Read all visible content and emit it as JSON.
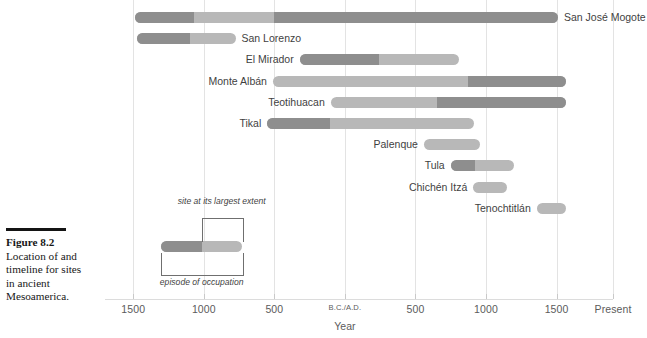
{
  "caption": {
    "rule": "horizontal-rule",
    "title": "Figure 8.2",
    "body": "Location of and timeline for sites in ancient Mesoamerica."
  },
  "legend": {
    "upper_label": "site at its largest extent",
    "lower_label": "episode of occupation"
  },
  "chart_data": {
    "type": "bar",
    "title": "Figure 8.2 Location of and timeline for sites in ancient Mesoamerica.",
    "xlabel": "Year",
    "ylabel": "",
    "grid": true,
    "legend_position": "inset-lower-left",
    "orientation": "horizontal",
    "note": "Horizontal timeline (Gantt style). Negative years = B.C., positive = A.D. Each site has a full occupation span (light gray) and a sub-span at its largest extent (dark gray).",
    "xlim": [
      -1700,
      1900
    ],
    "xticks": [
      -1500,
      -1000,
      -500,
      0,
      500,
      1000,
      1500,
      1900
    ],
    "xticklabels": [
      "1500",
      "1000",
      "500",
      "B.C./A.D.",
      "500",
      "1000",
      "1500",
      "Present"
    ],
    "colors": {
      "occupation": "#b8b8b8",
      "largest_extent": "#8e8e8e",
      "gridline": "#e3e3e3",
      "text": "#3f3f3f"
    },
    "categories": [
      "San José Mogote",
      "San Lorenzo",
      "El Mirador",
      "Monte Albán",
      "Teotihuacan",
      "Tikal",
      "Palenque",
      "Tula",
      "Chichén Itzá",
      "Tenochtitlán"
    ],
    "bars": [
      {
        "label": "San José Mogote",
        "label_side": "right",
        "occupation_start": -1490,
        "occupation_end": 1510,
        "extent_segments": [
          {
            "start": -1490,
            "end": -1070
          },
          {
            "start": -500,
            "end": 1510
          }
        ]
      },
      {
        "label": "San Lorenzo",
        "label_side": "right",
        "occupation_start": -1475,
        "occupation_end": -775,
        "extent_segments": [
          {
            "start": -1475,
            "end": -1100
          }
        ]
      },
      {
        "label": "El Mirador",
        "label_side": "left",
        "occupation_start": -320,
        "occupation_end": 810,
        "extent_segments": [
          {
            "start": -320,
            "end": 245
          }
        ]
      },
      {
        "label": "Monte Albán",
        "label_side": "left",
        "occupation_start": -510,
        "occupation_end": 1570,
        "extent_segments": [
          {
            "start": 870,
            "end": 1570
          }
        ]
      },
      {
        "label": "Teotihuacan",
        "label_side": "left",
        "occupation_start": -100,
        "occupation_end": 1570,
        "extent_segments": [
          {
            "start": 655,
            "end": 1570
          }
        ]
      },
      {
        "label": "Tikal",
        "label_side": "left",
        "occupation_start": -550,
        "occupation_end": 915,
        "extent_segments": [
          {
            "start": -550,
            "end": -105
          }
        ]
      },
      {
        "label": "Palenque",
        "label_side": "left",
        "occupation_start": 560,
        "occupation_end": 955,
        "extent_segments": []
      },
      {
        "label": "Tula",
        "label_side": "left",
        "occupation_start": 750,
        "occupation_end": 1200,
        "extent_segments": [
          {
            "start": 750,
            "end": 920
          }
        ]
      },
      {
        "label": "Chichén Itzá",
        "label_side": "left",
        "occupation_start": 910,
        "occupation_end": 1150,
        "extent_segments": []
      },
      {
        "label": "Tenochtitlán",
        "label_side": "left",
        "occupation_start": 1360,
        "occupation_end": 1565,
        "extent_segments": []
      }
    ]
  }
}
